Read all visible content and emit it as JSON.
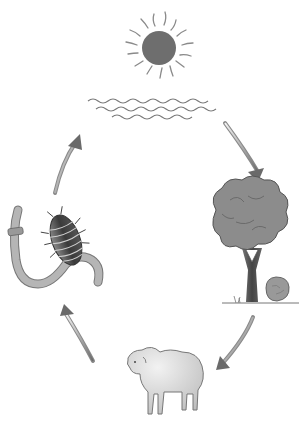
{
  "diagram": {
    "type": "cycle",
    "title": "",
    "direction": "clockwise",
    "colors": {
      "background": "#ffffff",
      "sun": "#6e6e6e",
      "rays": "#8a8a8a",
      "water": "#7a7a7a",
      "foliage": "#8c8c8c",
      "trunk": "#555555",
      "sheep": "#d9d9d9",
      "arrow": "#7a7a7a",
      "worm": "#a8a8a8",
      "beetle": "#4a4a4a"
    },
    "nodes": [
      {
        "id": "sun",
        "label": "",
        "icon": "sun-icon"
      },
      {
        "id": "water",
        "label": "",
        "icon": "water-waves-icon"
      },
      {
        "id": "tree",
        "label": "",
        "icon": "tree-icon"
      },
      {
        "id": "dead-matter",
        "label": "",
        "icon": "rock-icon"
      },
      {
        "id": "sheep",
        "label": "",
        "icon": "sheep-icon"
      },
      {
        "id": "decomposers",
        "label": "",
        "icon": "worm-and-woodlouse-icon"
      }
    ],
    "edges": [
      {
        "from": "water",
        "to": "tree",
        "icon": "arrow-icon"
      },
      {
        "from": "tree",
        "to": "sheep",
        "icon": "arrow-icon"
      },
      {
        "from": "sheep",
        "to": "decomposers",
        "icon": "arrow-icon"
      },
      {
        "from": "decomposers",
        "to": "water",
        "icon": "arrow-icon"
      }
    ]
  }
}
